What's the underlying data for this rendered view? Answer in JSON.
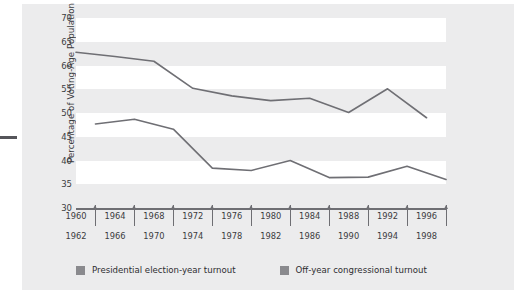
{
  "chart_data": {
    "type": "line",
    "title": "",
    "xlabel": "",
    "ylabel": "Percentage of Voting-Age Population",
    "ylim": [
      30,
      70
    ],
    "yticks": [
      70,
      65,
      60,
      55,
      50,
      45,
      40,
      35,
      30
    ],
    "grid": "alternating horizontal bands",
    "legend_position": "bottom",
    "x": [
      1960,
      1962,
      1964,
      1966,
      1968,
      1970,
      1972,
      1974,
      1976,
      1978,
      1980,
      1982,
      1984,
      1986,
      1988,
      1990,
      1992,
      1994,
      1996,
      1998
    ],
    "x_labels_row1": [
      "1960",
      "1964",
      "1968",
      "1972",
      "1976",
      "1980",
      "1984",
      "1988",
      "1992",
      "1996"
    ],
    "x_labels_row2": [
      "1962",
      "1966",
      "1970",
      "1974",
      "1978",
      "1982",
      "1986",
      "1990",
      "1994",
      "1998"
    ],
    "series": [
      {
        "name": "Presidential election-year turnout",
        "color": "#6f6f74",
        "x": [
          1960,
          1964,
          1968,
          1972,
          1976,
          1980,
          1984,
          1988,
          1992,
          1996
        ],
        "values": [
          62.8,
          61.9,
          60.9,
          55.2,
          53.6,
          52.6,
          53.1,
          50.1,
          55.1,
          49.0
        ]
      },
      {
        "name": "Off-year congressional turnout",
        "color": "#6f6f74",
        "x": [
          1962,
          1966,
          1970,
          1974,
          1978,
          1982,
          1986,
          1990,
          1994,
          1998
        ],
        "values": [
          47.7,
          48.7,
          46.6,
          38.4,
          37.9,
          40.0,
          36.4,
          36.5,
          38.8,
          36.0
        ]
      }
    ]
  },
  "legend": {
    "items": [
      {
        "label": "Presidential election-year turnout",
        "swatch": "#8a8a8e"
      },
      {
        "label": "Off-year congressional turnout",
        "swatch": "#8a8a8e"
      }
    ]
  },
  "axis": {
    "y_title": "Percentage of Voting-Age Population"
  }
}
